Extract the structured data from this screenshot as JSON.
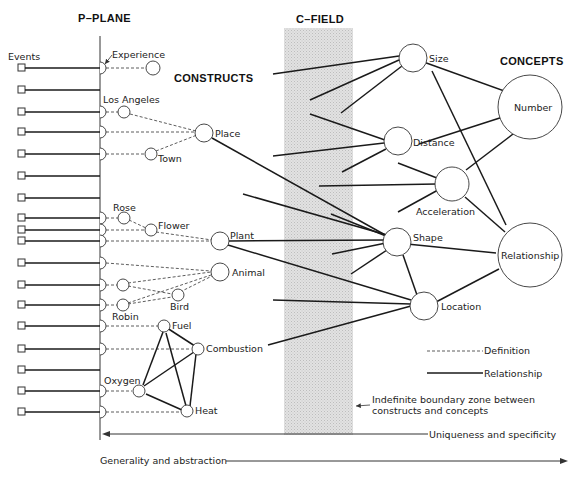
{
  "headers": {
    "p_plane": "P–PLANE",
    "c_field": "C–FIELD",
    "constructs": "CONSTRUCTS",
    "concepts": "CONCEPTS",
    "events": "Events"
  },
  "constructs": {
    "experience": "Experience",
    "los_angeles": "Los Angeles",
    "place": "Place",
    "town": "Town",
    "rose": "Rose",
    "flower": "Flower",
    "plant": "Plant",
    "animal": "Animal",
    "bird": "Bird",
    "robin": "Robin",
    "fuel": "Fuel",
    "combustion": "Combustion",
    "oxygen": "Oxygen",
    "heat": "Heat"
  },
  "concepts": {
    "size": "Size",
    "distance": "Distance",
    "acceleration": "Acceleration",
    "shape": "Shape",
    "location": "Location",
    "number": "Number",
    "relationship": "Relationship"
  },
  "legend": {
    "definition": "Definition",
    "relationship": "Relationship"
  },
  "annotations": {
    "boundary_line1": "Indefinite boundary zone between",
    "boundary_line2": "constructs and concepts",
    "uniqueness": "Uniqueness and specificity",
    "generality": "Generality and abstraction"
  },
  "colors": {
    "c_field_fill": "#d9d9d9",
    "ink": "#1a1a1a",
    "background": "#ffffff"
  },
  "event_rows": [
    68,
    90,
    112,
    132,
    154,
    176,
    198,
    218,
    230,
    241,
    263,
    285,
    305,
    326,
    349,
    370,
    391,
    412
  ]
}
